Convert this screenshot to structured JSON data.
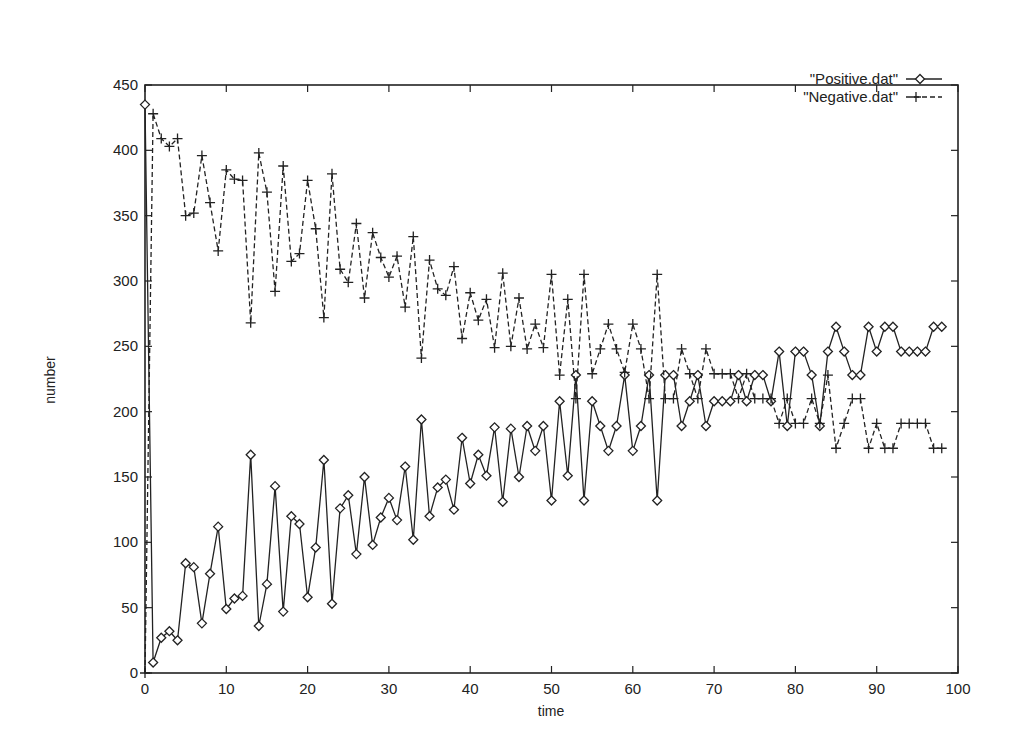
{
  "chart_data": {
    "type": "line",
    "title": "",
    "xlabel": "time",
    "ylabel": "number",
    "xlim": [
      0,
      100
    ],
    "ylim": [
      0,
      450
    ],
    "xticks": [
      0,
      10,
      20,
      30,
      40,
      50,
      60,
      70,
      80,
      90,
      100
    ],
    "yticks": [
      0,
      50,
      100,
      150,
      200,
      250,
      300,
      350,
      400,
      450
    ],
    "grid": false,
    "legend_position": "top-right",
    "x": [
      0,
      1,
      2,
      3,
      4,
      5,
      6,
      7,
      8,
      9,
      10,
      11,
      12,
      13,
      14,
      15,
      16,
      17,
      18,
      19,
      20,
      21,
      22,
      23,
      24,
      25,
      26,
      27,
      28,
      29,
      30,
      31,
      32,
      33,
      34,
      35,
      36,
      37,
      38,
      39,
      40,
      41,
      42,
      43,
      44,
      45,
      46,
      47,
      48,
      49,
      50,
      51,
      52,
      53,
      54,
      55,
      56,
      57,
      58,
      59,
      60,
      61,
      62,
      63,
      64,
      65,
      66,
      67,
      68,
      69,
      70,
      71,
      72,
      73,
      74,
      75,
      76,
      77,
      78,
      79,
      80,
      81,
      82,
      83,
      84,
      85,
      86,
      87,
      88,
      89,
      90,
      91,
      92,
      93,
      94,
      95,
      96,
      97,
      98
    ],
    "series": [
      {
        "name": "\"Positive.dat\"",
        "style": "solid",
        "marker": "diamond",
        "values": [
          435,
          8,
          27,
          32,
          25,
          84,
          81,
          38,
          76,
          112,
          49,
          57,
          59,
          167,
          36,
          68,
          143,
          47,
          120,
          114,
          58,
          96,
          163,
          53,
          126,
          136,
          91,
          150,
          98,
          119,
          134,
          117,
          158,
          102,
          194,
          120,
          142,
          148,
          125,
          180,
          145,
          167,
          151,
          188,
          131,
          187,
          150,
          189,
          170,
          189,
          132,
          208,
          151,
          228,
          132,
          208,
          189,
          170,
          189,
          228,
          170,
          189,
          228,
          132,
          228,
          228,
          189,
          208,
          228,
          189,
          208,
          208,
          208,
          228,
          208,
          228,
          228,
          208,
          246,
          189,
          246,
          246,
          228,
          189,
          246,
          265,
          246,
          228,
          228,
          265,
          246,
          265,
          265,
          246,
          246,
          246,
          246,
          265,
          265
        ]
      },
      {
        "name": "\"Negative.dat\"",
        "style": "dashed",
        "marker": "plus",
        "values": [
          0,
          428,
          409,
          403,
          409,
          350,
          352,
          396,
          360,
          323,
          385,
          378,
          377,
          268,
          398,
          368,
          292,
          388,
          315,
          321,
          377,
          340,
          272,
          382,
          309,
          299,
          344,
          287,
          337,
          318,
          303,
          319,
          280,
          334,
          241,
          316,
          294,
          289,
          311,
          256,
          291,
          270,
          286,
          249,
          306,
          250,
          287,
          248,
          267,
          249,
          305,
          228,
          286,
          210,
          305,
          229,
          248,
          267,
          248,
          230,
          267,
          248,
          210,
          305,
          210,
          210,
          248,
          229,
          210,
          248,
          229,
          229,
          229,
          210,
          229,
          210,
          210,
          210,
          191,
          210,
          191,
          191,
          210,
          191,
          228,
          172,
          191,
          210,
          210,
          172,
          191,
          172,
          172,
          191,
          191,
          191,
          191,
          172,
          172
        ]
      }
    ]
  },
  "legend": {
    "items": [
      {
        "label": "\"Positive.dat\""
      },
      {
        "label": "\"Negative.dat\""
      }
    ]
  },
  "axes": {
    "x_label": "time",
    "y_label": "number"
  }
}
